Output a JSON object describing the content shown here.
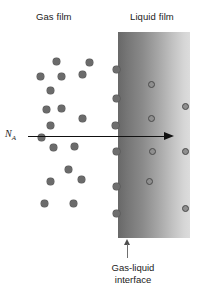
{
  "figure": {
    "background_color": "#ffffff"
  },
  "labels": {
    "gas_film": "Gas film",
    "liquid_film": "Liquid film",
    "flux_symbol": "N",
    "flux_subscript": "A",
    "interface_line1": "Gas-liquid",
    "interface_line2": "interface"
  },
  "colors": {
    "gas_particle": "#6b6b6b",
    "liquid_particle_fill": "#8f8f8f",
    "liquid_particle_stroke": "#4a4a4a",
    "band_dark": "#686868",
    "band_light": "#dcdcdc",
    "arrow": "#111111",
    "text": "#1a1a1a"
  },
  "geometry": {
    "liquid_band": {
      "x": 118,
      "y": 32,
      "width": 72,
      "height": 206
    },
    "flux_arrow": {
      "x1": 28,
      "y": 137,
      "x2": 174
    },
    "interface_x": 118
  },
  "gas_particles": [
    {
      "x": 53,
      "y": 58
    },
    {
      "x": 86,
      "y": 59
    },
    {
      "x": 37,
      "y": 73
    },
    {
      "x": 58,
      "y": 73
    },
    {
      "x": 79,
      "y": 71
    },
    {
      "x": 47,
      "y": 87
    },
    {
      "x": 43,
      "y": 106
    },
    {
      "x": 58,
      "y": 105
    },
    {
      "x": 79,
      "y": 115
    },
    {
      "x": 47,
      "y": 122
    },
    {
      "x": 38,
      "y": 134
    },
    {
      "x": 50,
      "y": 144
    },
    {
      "x": 71,
      "y": 143
    },
    {
      "x": 65,
      "y": 166
    },
    {
      "x": 47,
      "y": 178
    },
    {
      "x": 78,
      "y": 176
    },
    {
      "x": 41,
      "y": 200
    },
    {
      "x": 70,
      "y": 200
    }
  ],
  "interface_particles": [
    {
      "x": 113,
      "y": 66
    },
    {
      "x": 113,
      "y": 95
    },
    {
      "x": 112,
      "y": 122
    },
    {
      "x": 113,
      "y": 148
    },
    {
      "x": 113,
      "y": 183
    },
    {
      "x": 113,
      "y": 210
    }
  ],
  "liquid_particles": [
    {
      "x": 148,
      "y": 81
    },
    {
      "x": 182,
      "y": 103
    },
    {
      "x": 148,
      "y": 115
    },
    {
      "x": 149,
      "y": 148
    },
    {
      "x": 182,
      "y": 148
    },
    {
      "x": 146,
      "y": 178
    },
    {
      "x": 182,
      "y": 205
    }
  ]
}
